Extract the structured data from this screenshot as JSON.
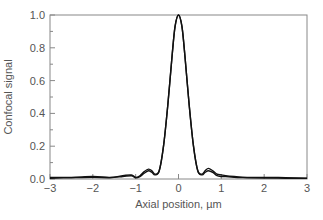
{
  "chart_data": {
    "type": "line",
    "title": "",
    "xlabel": "Axial position, µm",
    "ylabel": "Confocal signal",
    "xlim": [
      -3,
      3
    ],
    "ylim": [
      0,
      1.0
    ],
    "xticks": [
      -3,
      -2,
      -1,
      0,
      1,
      2,
      3
    ],
    "xtick_labels": [
      "−3",
      "−2",
      "−1",
      "0",
      "1",
      "2",
      "3"
    ],
    "yticks": [
      0,
      0.2,
      0.4,
      0.6,
      0.8,
      1.0
    ],
    "ytick_labels": [
      "0.0",
      "0.2",
      "0.4",
      "0.6",
      "0.8",
      "1.0"
    ],
    "grid": false,
    "legend": null,
    "line_color": "#111111",
    "frame_color": "#888888",
    "series": [
      {
        "name": "curve-1",
        "x": [
          -3.0,
          -2.5,
          -2.0,
          -1.6,
          -1.3,
          -1.1,
          -1.0,
          -0.9,
          -0.8,
          -0.7,
          -0.62,
          -0.55,
          -0.45,
          -0.35,
          -0.25,
          -0.15,
          -0.08,
          0.0,
          0.08,
          0.15,
          0.25,
          0.35,
          0.45,
          0.55,
          0.62,
          0.7,
          0.8,
          0.9,
          1.0,
          1.1,
          1.3,
          1.6,
          2.0,
          2.5,
          3.0
        ],
        "y": [
          0.01,
          0.01,
          0.015,
          0.01,
          0.02,
          0.025,
          0.01,
          0.02,
          0.045,
          0.06,
          0.05,
          0.03,
          0.05,
          0.2,
          0.45,
          0.75,
          0.93,
          1.0,
          0.93,
          0.75,
          0.45,
          0.2,
          0.05,
          0.03,
          0.05,
          0.065,
          0.05,
          0.03,
          0.025,
          0.02,
          0.015,
          0.01,
          0.01,
          0.008,
          0.005
        ]
      },
      {
        "name": "curve-2",
        "x": [
          -3.0,
          -2.5,
          -2.0,
          -1.6,
          -1.3,
          -1.1,
          -1.0,
          -0.9,
          -0.8,
          -0.7,
          -0.62,
          -0.55,
          -0.45,
          -0.35,
          -0.25,
          -0.15,
          -0.08,
          0.0,
          0.08,
          0.15,
          0.25,
          0.35,
          0.45,
          0.55,
          0.62,
          0.7,
          0.8,
          0.9,
          1.0,
          1.1,
          1.3,
          1.6,
          2.0,
          2.5,
          3.0
        ],
        "y": [
          0.005,
          0.008,
          0.01,
          0.008,
          0.015,
          0.02,
          0.008,
          0.015,
          0.035,
          0.05,
          0.04,
          0.025,
          0.05,
          0.2,
          0.45,
          0.75,
          0.93,
          1.0,
          0.93,
          0.75,
          0.45,
          0.2,
          0.05,
          0.025,
          0.04,
          0.05,
          0.04,
          0.02,
          0.015,
          0.015,
          0.01,
          0.008,
          0.006,
          0.005,
          0.004
        ]
      }
    ]
  }
}
